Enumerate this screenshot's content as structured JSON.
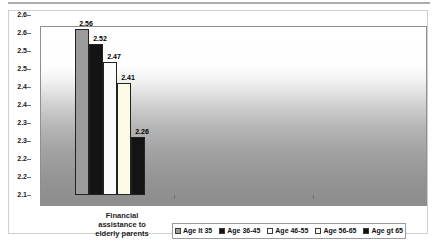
{
  "chart_data": {
    "type": "bar",
    "title": "",
    "categories": [
      "Financial assistance to elderly parents"
    ],
    "category_label_lines": [
      "Financial",
      "assistance to",
      "elderly parents"
    ],
    "series": [
      {
        "name": "Age lt 35",
        "values": [
          2.56
        ],
        "color": "#9b9b9b"
      },
      {
        "name": "Age 36-45",
        "values": [
          2.52
        ],
        "color": "#141414"
      },
      {
        "name": "Age 46-55",
        "values": [
          2.47
        ],
        "color": "#fcfcfc"
      },
      {
        "name": "Age 56-65",
        "values": [
          2.41
        ],
        "color": "#fbfbe6"
      },
      {
        "name": "Age gt 65",
        "values": [
          2.26
        ],
        "color": "#141414"
      }
    ],
    "data_labels": [
      "2.56",
      "2.52",
      "2.47",
      "2.41",
      "2.26"
    ],
    "ylim": [
      2.1,
      2.6
    ],
    "ytick_step": 0.05,
    "ytick_labels": [
      "2.6",
      "2.6",
      "2.5",
      "2.5",
      "2.4",
      "2.4",
      "2.3",
      "2.3",
      "2.2",
      "2.2",
      "2.1"
    ],
    "grid": false,
    "legend_position": "bottom",
    "plot_background_gradient": [
      "#ffffff",
      "#8d8d8d"
    ],
    "bar_border_color": "#222222"
  },
  "colors": {
    "chart_frame_border": "#cfcfcf",
    "plot_border": "#8f8f8f",
    "legend_border": "#9a9a9a",
    "text": "#111111"
  }
}
